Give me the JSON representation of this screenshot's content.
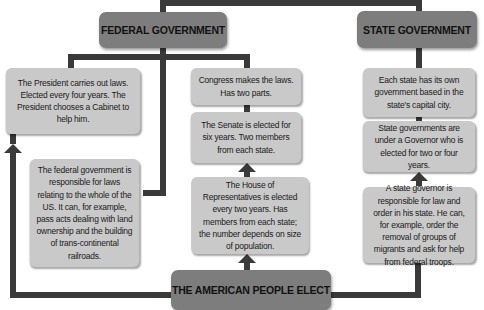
{
  "diagram": {
    "headers": {
      "federal": "FEDERAL GOVERNMENT",
      "state": "STATE GOVERNMENT",
      "people": "THE AMERICAN PEOPLE ELECT"
    },
    "federal_column": {
      "president": "The President carries out laws. Elected every four years. The President chooses a Cabinet to help him.",
      "federal_role": "The federal government is responsible for laws relating to the whole of the US. It can, for example, pass acts dealing with land ownership and the building of trans-continental railroads."
    },
    "congress_column": {
      "congress": "Congress makes the laws. Has two parts.",
      "senate": "The Senate is elected for six years. Two members from each state.",
      "house": "The House of Representatives is elected every two years. Has members from each state; the number depends on size of population."
    },
    "state_column": {
      "state_gov": "Each state has its own government based in the state's capital city.",
      "governor": "State governments are under a Governor who is elected for two or four years.",
      "governor_role": "A state governor is responsible for law and order in his state. He can, for example, order the removal of groups of migrants and ask for help from federal troops."
    },
    "colors": {
      "connector": "#3a3a3a",
      "header_fill": "#7d7d7d",
      "box_fill": "#c9c9c9"
    }
  }
}
